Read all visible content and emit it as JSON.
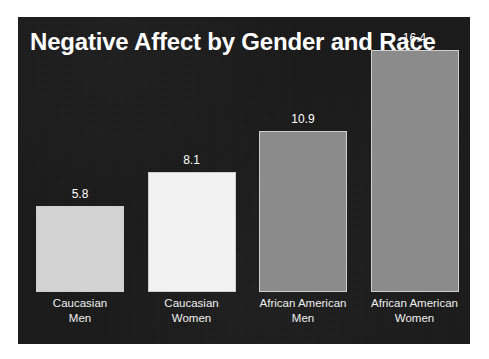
{
  "chart_data": {
    "type": "bar",
    "title": "Negative Affect by Gender and Race",
    "xlabel": "",
    "ylabel": "",
    "categories": [
      "Caucasian Men",
      "Caucasian Women",
      "African American Men",
      "African American Women"
    ],
    "category_lines": [
      [
        "Caucasian",
        "Men"
      ],
      [
        "Caucasian",
        "Women"
      ],
      [
        "African American",
        "Men"
      ],
      [
        "African American",
        "Women"
      ]
    ],
    "values": [
      5.8,
      8.1,
      10.9,
      16.4
    ],
    "value_labels": [
      "5.8",
      "8.1",
      "10.9",
      "16.4"
    ],
    "bar_colors": [
      "#d2d2d2",
      "#f2f2f2",
      "#8b8b8b",
      "#8b8b8b"
    ],
    "ylim": [
      0,
      18.6
    ],
    "grid": false,
    "legend": false,
    "data_labels": true
  },
  "panel": {
    "background_color": "#191919",
    "text_color": "#ffffff",
    "bar_border_color": "#cfcfcf"
  },
  "page": {
    "background_color": "#ffffff"
  }
}
